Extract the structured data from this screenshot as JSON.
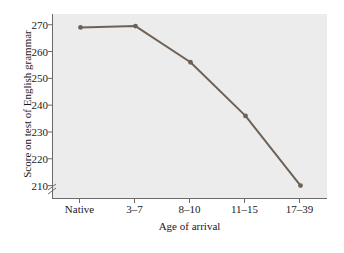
{
  "chart_data": {
    "type": "line",
    "title": "",
    "subtitle": "",
    "xlabel": "Age of arrival",
    "ylabel": "Score on test of English grammar",
    "categories": [
      "Native",
      "3–7",
      "8–10",
      "11–15",
      "17–39"
    ],
    "values": [
      269,
      269.5,
      256,
      236,
      210
    ],
    "series": [
      {
        "name": "Score on test of English grammar",
        "values": [
          269,
          269.5,
          256,
          236,
          210
        ]
      }
    ],
    "yticks": [
      270,
      260,
      250,
      240,
      230,
      220,
      210
    ],
    "ytick_labels": [
      "270",
      "260",
      "250",
      "240",
      "230",
      "220",
      "210"
    ],
    "ylim": [
      205,
      274
    ],
    "axis_break": true,
    "axis_break_symbol": "≈",
    "grid": false,
    "legend": "none",
    "marker": "circle",
    "line_color": "#6e6257",
    "marker_color": "#6e6257",
    "panel_background": "#ececec",
    "axis_color": "#6a6a6a",
    "text_color": "#1a1a1a"
  }
}
